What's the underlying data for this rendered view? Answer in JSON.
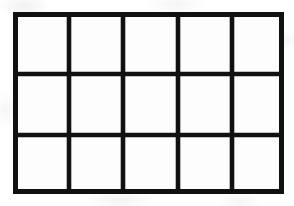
{
  "figure": {
    "name": "grid-table",
    "rows": 3,
    "columns": 5,
    "cell_count": 15,
    "line_color": "#111111",
    "cell_fill": "#fdfdfd",
    "background_color": "#ffffff",
    "outer_stroke_px": 5,
    "inner_stroke_px": 4,
    "bounds": {
      "left": 13,
      "top": 12,
      "width": 271,
      "height": 182
    },
    "vertical_line_x": [
      2.5,
      56,
      110,
      165,
      219,
      268.5
    ],
    "horizontal_line_y": [
      2.5,
      62,
      123,
      179.5
    ],
    "cells": [
      {
        "row": 1,
        "column": 1,
        "label": ""
      },
      {
        "row": 1,
        "column": 2,
        "label": ""
      },
      {
        "row": 1,
        "column": 3,
        "label": ""
      },
      {
        "row": 1,
        "column": 4,
        "label": ""
      },
      {
        "row": 1,
        "column": 5,
        "label": ""
      },
      {
        "row": 2,
        "column": 1,
        "label": ""
      },
      {
        "row": 2,
        "column": 2,
        "label": ""
      },
      {
        "row": 2,
        "column": 3,
        "label": ""
      },
      {
        "row": 2,
        "column": 4,
        "label": ""
      },
      {
        "row": 2,
        "column": 5,
        "label": ""
      },
      {
        "row": 3,
        "column": 1,
        "label": ""
      },
      {
        "row": 3,
        "column": 2,
        "label": ""
      },
      {
        "row": 3,
        "column": 3,
        "label": ""
      },
      {
        "row": 3,
        "column": 4,
        "label": ""
      },
      {
        "row": 3,
        "column": 5,
        "label": ""
      }
    ]
  }
}
